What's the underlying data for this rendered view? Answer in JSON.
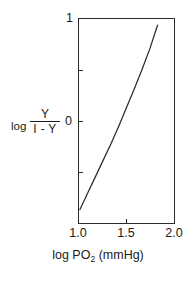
{
  "figure": {
    "background_color": "#ffffff",
    "line_color": "#2b2b2b",
    "text_color": "#1a1a1a"
  },
  "axes": {
    "y_title": {
      "prefix": "log",
      "numerator": "Y",
      "denominator": "I - Y"
    },
    "x_title_prefix": "log PO",
    "x_title_sub": "2",
    "x_title_suffix": " (mmHg)",
    "y_ticks_labeled": [
      "1",
      "0"
    ],
    "x_ticks_labeled": [
      "1.0",
      "1.5",
      "2.0"
    ]
  },
  "chart_data": {
    "type": "line",
    "title": "",
    "subtitle": "",
    "xlabel": "log PO2 (mmHg)",
    "ylabel": "log Y / (I - Y)",
    "xlim": [
      1.0,
      2.0
    ],
    "ylim": [
      -1.0,
      1.0
    ],
    "xticks": [
      1.0,
      1.5,
      2.0
    ],
    "xticklabels": [
      "1.0",
      "1.5",
      "2.0"
    ],
    "yticks": [
      -0.5,
      0.0,
      0.5,
      1.0
    ],
    "yticklabels": [
      "",
      "0",
      "",
      "1"
    ],
    "grid": false,
    "legend": null,
    "series": [
      {
        "name": "Hill plot",
        "x": [
          1.02,
          1.1,
          1.18,
          1.26,
          1.34,
          1.42,
          1.5,
          1.58,
          1.66,
          1.74,
          1.82
        ],
        "y": [
          -0.86,
          -0.7,
          -0.54,
          -0.38,
          -0.22,
          -0.05,
          0.13,
          0.31,
          0.5,
          0.7,
          0.93
        ]
      }
    ],
    "annotations": []
  }
}
